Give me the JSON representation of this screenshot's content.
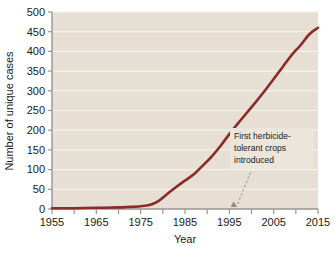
{
  "chart_data": {
    "type": "line",
    "title": "",
    "xlabel": "Year",
    "ylabel": "Number of unique cases",
    "xlim": [
      1955,
      2015
    ],
    "ylim": [
      0,
      500
    ],
    "xticks": [
      1955,
      1965,
      1975,
      1985,
      1995,
      2005,
      2015
    ],
    "xtick_labels": [
      "1955",
      "1965",
      "1975",
      "1985",
      "1995",
      "2005",
      "2015"
    ],
    "xminor_ticks": [
      1960,
      1970,
      1980,
      1990,
      2000,
      2010
    ],
    "yticks": [
      0,
      50,
      100,
      150,
      200,
      250,
      300,
      350,
      400,
      450,
      500
    ],
    "ytick_labels": [
      "0",
      "50",
      "100",
      "150",
      "200",
      "250",
      "300",
      "350",
      "400",
      "450",
      "500"
    ],
    "grid": "horizontal",
    "legend": "none",
    "series": [
      {
        "name": "Number of unique cases",
        "color": "#8a2b27",
        "x": [
          1955,
          1960,
          1965,
          1970,
          1972,
          1975,
          1977,
          1979,
          1981,
          1983,
          1985,
          1987,
          1989,
          1991,
          1993,
          1995,
          1997,
          1999,
          2001,
          2003,
          2005,
          2007,
          2009,
          2011,
          2013,
          2015
        ],
        "values": [
          2,
          2,
          3,
          4,
          5,
          7,
          10,
          20,
          38,
          56,
          72,
          88,
          110,
          133,
          160,
          190,
          218,
          245,
          272,
          300,
          330,
          360,
          390,
          415,
          443,
          460
        ]
      }
    ],
    "annotations": [
      {
        "name": "first-herbicide-tolerant-crops",
        "lines": [
          "First herbicide-",
          "tolerant crops",
          "introduced"
        ],
        "point_x": 1996,
        "point_y": 0
      }
    ]
  },
  "colors": {
    "plot_background": "#e7ded4",
    "gridline": "#f6f1ea",
    "axis": "#9a948e",
    "line": "#8a2b27",
    "text": "#1a1a1a",
    "annotation_box": "#ece5dc",
    "leader_line": "#8e8880"
  }
}
